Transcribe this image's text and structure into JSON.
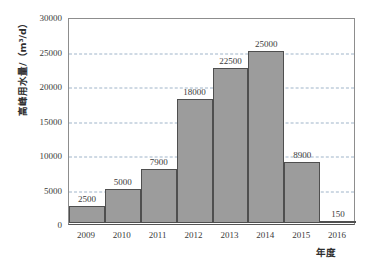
{
  "chart_data": {
    "type": "bar",
    "title": "",
    "subtitle": "",
    "categories": [
      "2009",
      "2010",
      "2011",
      "2012",
      "2013",
      "2014",
      "2015",
      "2016"
    ],
    "values": [
      2500,
      5000,
      7900,
      18000,
      22500,
      25000,
      8900,
      150
    ],
    "data_labels": [
      "2500",
      "5000",
      "7900",
      "18000",
      "22500",
      "25000",
      "8900",
      "150"
    ],
    "xlabel": "年度",
    "ylabel": "高峰用水量/（m³/d）",
    "ylim": [
      0,
      30000
    ],
    "yticks": [
      0,
      5000,
      10000,
      15000,
      20000,
      25000,
      30000
    ],
    "ytick_labels": [
      "0",
      "5000",
      "10000",
      "15000",
      "20000",
      "25000",
      "30000"
    ],
    "grid": true,
    "grid_axis": "y",
    "grid_style": "dashed",
    "legend": false,
    "legend_position": "none",
    "colors": {
      "bar_fill": "#9c9c9c",
      "bar_border": "#4f4f4f",
      "gridline": "#9fb4c9",
      "axis": "#555555",
      "plot_border": "#8d8d8d",
      "text": "#3b3b3b",
      "background": "#ffffff"
    }
  }
}
